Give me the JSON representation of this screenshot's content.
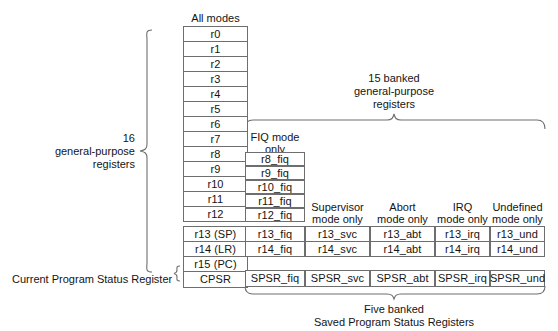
{
  "diagram": {
    "title_alt": "ARM register organization",
    "line_color": "#6e6e6e",
    "text_color": "#141414",
    "background": "#ffffff"
  },
  "columns": {
    "all_modes": {
      "header": "All modes",
      "registers": [
        "r0",
        "r1",
        "r2",
        "r3",
        "r4",
        "r5",
        "r6",
        "r7",
        "r8",
        "r9",
        "r10",
        "r11",
        "r12",
        "r13 (SP)",
        "r14 (LR)",
        "r15 (PC)"
      ],
      "status_register": "CPSR"
    },
    "fiq": {
      "header_line1": "FIQ mode",
      "header_line2": "only",
      "registers": [
        "r8_fiq",
        "r9_fiq",
        "r10_fiq",
        "r11_fiq",
        "r12_fiq",
        "r13_fiq",
        "r14_fiq"
      ],
      "status_register": "SPSR_fiq"
    },
    "svc": {
      "header_line1": "Supervisor",
      "header_line2": "mode only",
      "registers": [
        "r13_svc",
        "r14_svc"
      ],
      "status_register": "SPSR_svc"
    },
    "abt": {
      "header_line1": "Abort",
      "header_line2": "mode only",
      "registers": [
        "r13_abt",
        "r14_abt"
      ],
      "status_register": "SPSR_abt"
    },
    "irq": {
      "header_line1": "IRQ",
      "header_line2": "mode only",
      "registers": [
        "r13_irq",
        "r14_irq"
      ],
      "status_register": "SPSR_irq"
    },
    "und": {
      "header_line1": "Undefined",
      "header_line2": "mode only",
      "registers": [
        "r13_und",
        "r14_und"
      ],
      "status_register": "SPSR_und"
    }
  },
  "annotations": {
    "left_brace_label_line1": "16",
    "left_brace_label_line2": "general-purpose",
    "left_brace_label_line3": "registers",
    "cpsr_label": "Current Program Status Register",
    "top_brace_label_line1": "15 banked",
    "top_brace_label_line2": "general-purpose",
    "top_brace_label_line3": "registers",
    "bottom_brace_label_line1": "Five banked",
    "bottom_brace_label_line2": "Saved Program Status Registers"
  }
}
